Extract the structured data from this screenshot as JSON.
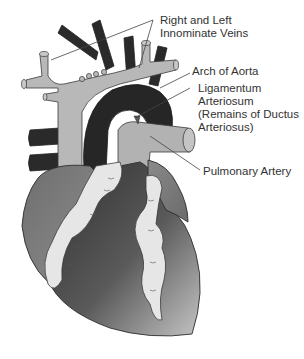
{
  "diagram": {
    "colors": {
      "vein_light": "#b8b8b8",
      "vessel_dark": "#2a2a2a",
      "heart_mid": "#7d7d7d",
      "heart_dark": "#3a3a3a",
      "fat_light": "#e6e6e6",
      "outline": "#333333",
      "text": "#333333",
      "background": "#ffffff"
    },
    "labels": [
      {
        "id": "innominate-veins",
        "lines": [
          "Right and Left",
          "Innominate Veins"
        ]
      },
      {
        "id": "arch-of-aorta",
        "lines": [
          "Arch of Aorta"
        ]
      },
      {
        "id": "ligamentum-arteriosum",
        "lines": [
          "Ligamentum",
          "Arteriosum",
          "(Remains of Ductus",
          "Arteriosus)"
        ]
      },
      {
        "id": "pulmonary-artery",
        "lines": [
          "Pulmonary Artery"
        ]
      }
    ]
  }
}
